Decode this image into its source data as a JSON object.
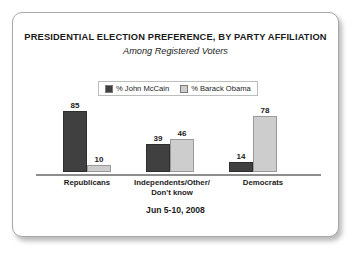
{
  "chart_data": {
    "type": "bar",
    "title": "PRESIDENTIAL ELECTION PREFERENCE, BY PARTY AFFILIATION",
    "subtitle": "Among Registered Voters",
    "footer": "Jun 5-10, 2008",
    "xlabel": "",
    "ylabel": "",
    "ylim": [
      0,
      100
    ],
    "grid": false,
    "legend_position": "top-center",
    "categories": [
      "Republicans",
      "Independents/Other/\nDon't know",
      "Democrats"
    ],
    "category_lines": [
      [
        "Republicans"
      ],
      [
        "Independents/Other/",
        "Don't know"
      ],
      [
        "Democrats"
      ]
    ],
    "series": [
      {
        "name": "% John McCain",
        "color": "#404040",
        "values": [
          85,
          39,
          14
        ]
      },
      {
        "name": "% Barack Obama",
        "color": "#cdcdcd",
        "values": [
          10,
          46,
          78
        ]
      }
    ]
  },
  "legend": {
    "items": [
      {
        "label": "% John McCain",
        "color": "#404040"
      },
      {
        "label": "% Barack Obama",
        "color": "#cdcdcd"
      }
    ]
  },
  "colors": {
    "mccain": "#404040",
    "obama": "#cdcdcd",
    "axis": "#8d8d8d",
    "text": "#1b1b1b",
    "card_border": "#a8a8a8"
  }
}
